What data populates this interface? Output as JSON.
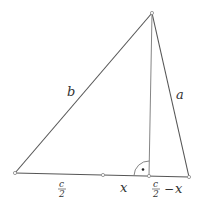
{
  "diagram": {
    "type": "triangle-with-altitude",
    "vertices": {
      "A": {
        "x": 15,
        "y": 173
      },
      "B": {
        "x": 189,
        "y": 177
      },
      "C": {
        "x": 152,
        "y": 13
      }
    },
    "points": {
      "midpoint": {
        "x": 103,
        "y": 175
      },
      "foot": {
        "x": 149,
        "y": 176
      }
    },
    "labels": {
      "side_b": "b",
      "side_a": "a",
      "segment_left": {
        "num": "c",
        "den": "2"
      },
      "segment_x": "x",
      "segment_right": {
        "num": "c",
        "den": "2",
        "op": "−",
        "var": "x"
      }
    },
    "right_angle_marker": {
      "center": {
        "x": 149,
        "y": 176
      },
      "radius": 15,
      "dot": {
        "x": 143,
        "y": 169
      }
    },
    "colors": {
      "edge": "#555555",
      "altitude": "#777777",
      "text": "#333333",
      "background": "#ffffff"
    }
  }
}
